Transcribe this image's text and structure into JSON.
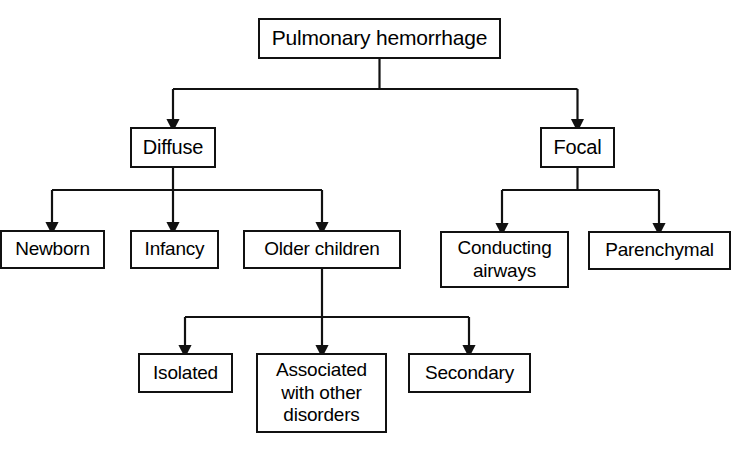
{
  "diagram": {
    "type": "tree-flowchart",
    "canvas": {
      "width": 740,
      "height": 451
    },
    "colors": {
      "stroke": "#111111",
      "fill": "#ffffff",
      "text": "#000000"
    },
    "nodes": [
      {
        "id": "root",
        "label": "Pulmonary hemorrhage",
        "level": 0,
        "x": 258,
        "y": 18,
        "w": 243,
        "h": 41
      },
      {
        "id": "diffuse",
        "label": "Diffuse",
        "level": 1,
        "x": 130,
        "y": 127,
        "w": 86,
        "h": 41
      },
      {
        "id": "focal",
        "label": "Focal",
        "level": 1,
        "x": 540,
        "y": 127,
        "w": 75,
        "h": 41
      },
      {
        "id": "newborn",
        "label": "Newborn",
        "level": 2,
        "x": 0,
        "y": 230,
        "w": 105,
        "h": 39
      },
      {
        "id": "infancy",
        "label": "Infancy",
        "level": 2,
        "x": 130,
        "y": 230,
        "w": 89,
        "h": 39
      },
      {
        "id": "older",
        "label": "Older children",
        "level": 2,
        "x": 243,
        "y": 230,
        "w": 158,
        "h": 39
      },
      {
        "id": "conducting",
        "label": "Conducting\nairways",
        "level": 2,
        "x": 440,
        "y": 231,
        "w": 129,
        "h": 57
      },
      {
        "id": "parenchymal",
        "label": "Parenchymal",
        "level": 2,
        "x": 588,
        "y": 231,
        "w": 143,
        "h": 39
      },
      {
        "id": "isolated",
        "label": "Isolated",
        "level": 3,
        "x": 138,
        "y": 353,
        "w": 95,
        "h": 40
      },
      {
        "id": "associated",
        "label": "Associated\nwith other\ndisorders",
        "level": 3,
        "x": 256,
        "y": 353,
        "w": 131,
        "h": 80
      },
      {
        "id": "secondary",
        "label": "Secondary",
        "level": 3,
        "x": 408,
        "y": 353,
        "w": 123,
        "h": 40
      }
    ],
    "edges": [
      {
        "from": "root",
        "to": "diffuse"
      },
      {
        "from": "root",
        "to": "focal"
      },
      {
        "from": "diffuse",
        "to": "newborn"
      },
      {
        "from": "diffuse",
        "to": "infancy"
      },
      {
        "from": "diffuse",
        "to": "older"
      },
      {
        "from": "focal",
        "to": "conducting"
      },
      {
        "from": "focal",
        "to": "parenchymal"
      },
      {
        "from": "older",
        "to": "isolated"
      },
      {
        "from": "older",
        "to": "associated"
      },
      {
        "from": "older",
        "to": "secondary"
      }
    ]
  }
}
